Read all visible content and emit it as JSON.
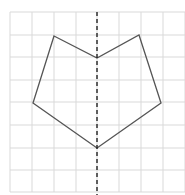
{
  "figure": {
    "grid": {
      "x_lines": [
        10,
        32,
        54,
        76,
        97,
        119,
        141,
        163,
        185
      ],
      "y_lines": [
        12,
        35,
        57,
        80,
        102,
        125,
        148,
        170,
        192
      ],
      "color": "#d9d9d9"
    },
    "shape": {
      "points": "54,36 97,58 139,35 161,103 97,148 33,103",
      "stroke": "#555555"
    },
    "axis": {
      "x": 97,
      "y1": 12,
      "y2": 195,
      "stroke": "#222222",
      "dash": "4,3"
    }
  }
}
